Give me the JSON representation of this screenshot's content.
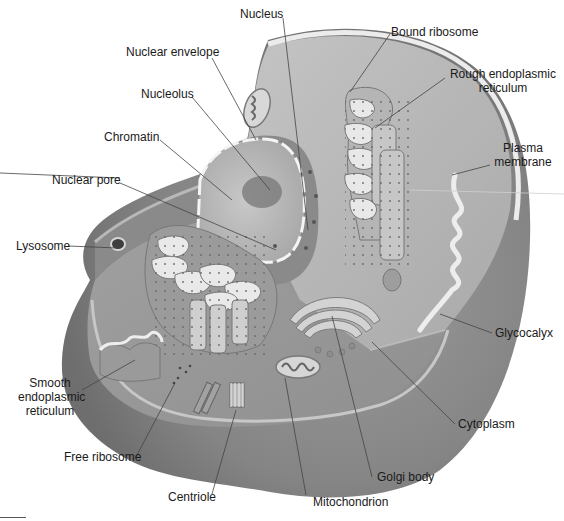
{
  "diagram": {
    "colors": {
      "cytoplasm_outer": "#8e8e8e",
      "cytoplasm_inner": "#a8a8a8",
      "membrane": "#e6e6e6",
      "nucleus": "#bdbdbd",
      "nucleolus": "#7a7a7a",
      "leader_line": "#444444",
      "label_text": "#1a1a1a"
    },
    "labels": [
      {
        "id": "nucleus",
        "text": "Nucleus"
      },
      {
        "id": "nuclear-envelope",
        "text": "Nuclear envelope"
      },
      {
        "id": "nucleolus",
        "text": "Nucleolus"
      },
      {
        "id": "chromatin",
        "text": "Chromatin"
      },
      {
        "id": "nuclear-pore",
        "text": "Nuclear pore"
      },
      {
        "id": "lysosome",
        "text": "Lysosome"
      },
      {
        "id": "smooth-er",
        "text": "Smooth\nendoplasmic\nreticulum",
        "lines": [
          "Smooth",
          "endoplasmic",
          "reticulum"
        ]
      },
      {
        "id": "free-ribosome",
        "text": "Free ribosome"
      },
      {
        "id": "centriole",
        "text": "Centriole"
      },
      {
        "id": "mitochondrion",
        "text": "Mitochondrion"
      },
      {
        "id": "golgi-body",
        "text": "Golgi body"
      },
      {
        "id": "cytoplasm",
        "text": "Cytoplasm"
      },
      {
        "id": "glycocalyx",
        "text": "Glycocalyx"
      },
      {
        "id": "plasma-membrane",
        "text": "Plasma membrane",
        "lines": [
          "Plasma",
          "membrane"
        ]
      },
      {
        "id": "rough-er",
        "text": "Rough endoplasmic reticulum",
        "lines": [
          "Rough endoplasmic",
          "reticulum"
        ]
      },
      {
        "id": "bound-ribosome",
        "text": "Bound ribosome"
      }
    ]
  }
}
